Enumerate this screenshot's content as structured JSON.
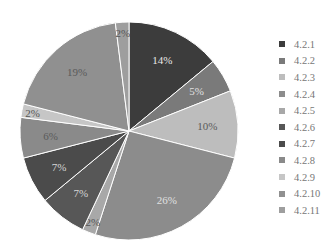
{
  "chart_data": {
    "type": "pie",
    "title": "",
    "start_angle": "12 o'clock, clockwise",
    "categories": [
      "4.2.1",
      "4.2.2",
      "4.2.3",
      "4.2.4",
      "4.2.5",
      "4.2.6",
      "4.2.7",
      "4.2.8",
      "4.2.9",
      "4.2.10",
      "4.2.11"
    ],
    "values": [
      14,
      5,
      10,
      26,
      2,
      7,
      7,
      6,
      2,
      19,
      2
    ],
    "labels": [
      "14%",
      "5%",
      "10%",
      "26%",
      "2%",
      "7%",
      "7%",
      "6%",
      "2%",
      "19%",
      "2%"
    ],
    "colors": [
      "#3c3c3c",
      "#7a7a7a",
      "#bdbdbd",
      "#8c8c8c",
      "#a8a8a8",
      "#575757",
      "#4b4b4b",
      "#8a8a8a",
      "#c6c6c6",
      "#909090",
      "#9e9e9e"
    ],
    "label_colors": [
      "#e8e8e8",
      "#e0e0e0",
      "#5a5a5a",
      "#e0e0e0",
      "#555555",
      "#d8d8d8",
      "#d8d8d8",
      "#5a5a5a",
      "#555555",
      "#5a5a5a",
      "#555555"
    ],
    "legend_position": "right"
  }
}
